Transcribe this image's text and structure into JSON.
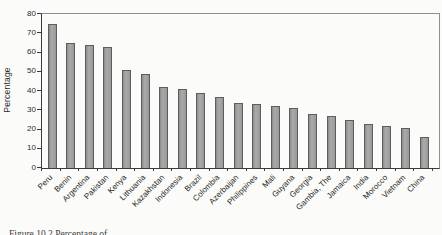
{
  "figure": {
    "caption": "Figure 10.2 Percentage of"
  },
  "chart_data": {
    "type": "bar",
    "title": "",
    "xlabel": "",
    "ylabel": "Percentage",
    "ylim": [
      0,
      80
    ],
    "y_ticks": [
      0,
      10,
      20,
      30,
      40,
      50,
      60,
      70,
      80
    ],
    "grid": false,
    "legend": "none",
    "bar_color": "#9a9a9a",
    "bar_border_color": "#5d5d5d",
    "categories": [
      "Peru",
      "Benin",
      "Argentina",
      "Pakistan",
      "Kenya",
      "Lithuania",
      "Kazakhstan",
      "Indonesia",
      "Brazil",
      "Colombia",
      "Azerbaijan",
      "Philippines",
      "Mali",
      "Guyana",
      "Georgia",
      "Gambia, The",
      "Jamaica",
      "India",
      "Morocco",
      "Vietnam",
      "China"
    ],
    "values": [
      75,
      65,
      64,
      63,
      51,
      49,
      42,
      41,
      39,
      37,
      34,
      33,
      32,
      31,
      28,
      27,
      25,
      23,
      22,
      21,
      16
    ]
  }
}
